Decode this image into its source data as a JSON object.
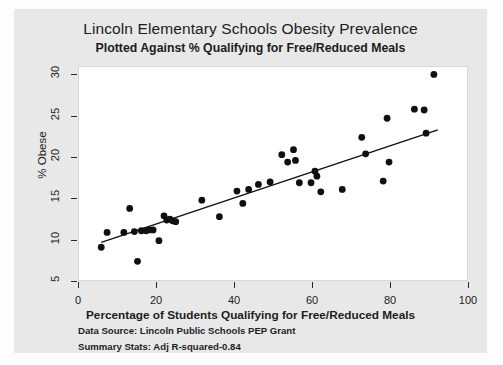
{
  "figure": {
    "main_title": "Lincoln Elementary Schools Obesity Prevalence",
    "sub_title": "Plotted Against % Qualifying for Free/Reduced Meals",
    "footnotes": [
      "Data Source: Lincoln Public Schools PEP Grant",
      "Summary Stats: Adj R-squared-0.84"
    ],
    "colors": {
      "page_background": "#fdfdfd",
      "figure_background": "#e8e8e8",
      "plot_background": "#ffffff",
      "marker": "#101010",
      "fit_line": "#101010",
      "axis": "#2a2a2a"
    }
  },
  "chart_data": {
    "type": "scatter",
    "title": "Lincoln Elementary Schools Obesity Prevalence",
    "subtitle": "Plotted Against % Qualifying for Free/Reduced Meals",
    "xlabel": "Percentage of Students Qualifying for Free/Reduced Meals",
    "ylabel": "% Obese",
    "xlim": [
      0,
      100
    ],
    "ylim": [
      5,
      31
    ],
    "xticks": [
      0,
      20,
      40,
      60,
      80,
      100
    ],
    "yticks": [
      5,
      10,
      15,
      20,
      25,
      30
    ],
    "grid": false,
    "legend": null,
    "marker_style": "filled-circle",
    "adj_r_squared": 0.84,
    "points": [
      {
        "x": 5.7,
        "y": 9.2
      },
      {
        "x": 7.2,
        "y": 11.0
      },
      {
        "x": 11.5,
        "y": 11.0
      },
      {
        "x": 13.0,
        "y": 13.9
      },
      {
        "x": 14.2,
        "y": 11.1
      },
      {
        "x": 15.0,
        "y": 7.5
      },
      {
        "x": 16.0,
        "y": 11.2
      },
      {
        "x": 17.2,
        "y": 11.2
      },
      {
        "x": 18.0,
        "y": 11.3
      },
      {
        "x": 19.0,
        "y": 11.3
      },
      {
        "x": 20.5,
        "y": 10.0
      },
      {
        "x": 21.8,
        "y": 13.0
      },
      {
        "x": 22.5,
        "y": 12.5
      },
      {
        "x": 23.3,
        "y": 12.6
      },
      {
        "x": 24.0,
        "y": 12.4
      },
      {
        "x": 24.8,
        "y": 12.3
      },
      {
        "x": 31.5,
        "y": 14.9
      },
      {
        "x": 36.0,
        "y": 12.9
      },
      {
        "x": 40.5,
        "y": 16.0
      },
      {
        "x": 42.0,
        "y": 14.5
      },
      {
        "x": 43.5,
        "y": 16.2
      },
      {
        "x": 46.0,
        "y": 16.8
      },
      {
        "x": 49.0,
        "y": 17.1
      },
      {
        "x": 52.0,
        "y": 20.4
      },
      {
        "x": 53.5,
        "y": 19.5
      },
      {
        "x": 55.0,
        "y": 21.0
      },
      {
        "x": 55.5,
        "y": 19.7
      },
      {
        "x": 56.5,
        "y": 17.0
      },
      {
        "x": 59.5,
        "y": 17.0
      },
      {
        "x": 60.5,
        "y": 18.4
      },
      {
        "x": 61.0,
        "y": 17.8
      },
      {
        "x": 62.0,
        "y": 15.9
      },
      {
        "x": 67.5,
        "y": 16.2
      },
      {
        "x": 72.5,
        "y": 22.5
      },
      {
        "x": 73.5,
        "y": 20.5
      },
      {
        "x": 78.0,
        "y": 17.2
      },
      {
        "x": 79.0,
        "y": 24.8
      },
      {
        "x": 79.5,
        "y": 19.5
      },
      {
        "x": 86.0,
        "y": 25.9
      },
      {
        "x": 88.5,
        "y": 25.8
      },
      {
        "x": 89.0,
        "y": 23.0
      },
      {
        "x": 91.0,
        "y": 30.1
      }
    ],
    "fit_line": {
      "x_start": 5.7,
      "y_start": 9.8,
      "x_end": 92.0,
      "y_end": 23.4
    }
  }
}
